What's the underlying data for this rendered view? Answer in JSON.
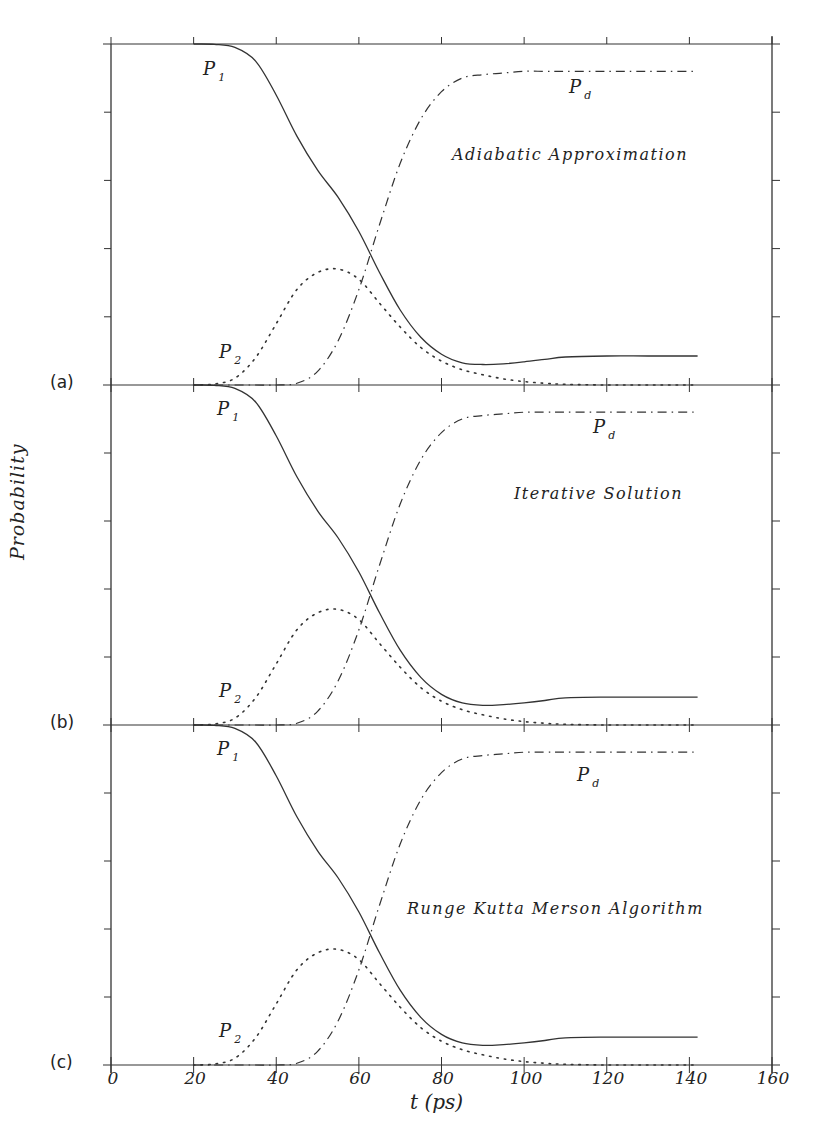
{
  "figure": {
    "y_axis_label": "Probability",
    "x_axis_label": "t (ps)",
    "x_ticks": [
      "0",
      "20",
      "40",
      "60",
      "80",
      "100",
      "120",
      "140",
      "160"
    ],
    "panels": [
      {
        "tag": "(a)",
        "method": "Adiabatic Approximation"
      },
      {
        "tag": "(b)",
        "method": "Iterative Solution"
      },
      {
        "tag": "(c)",
        "method": "Runge Kutta Merson Algorithm"
      }
    ],
    "curve_labels": {
      "p1": "P",
      "p1_sub": "1",
      "p2": "P",
      "p2_sub": "2",
      "pd": "P",
      "pd_sub": "d"
    }
  },
  "chart_data": [
    {
      "type": "line",
      "title": "Adiabatic Approximation",
      "panel": "(a)",
      "xlabel": "t (ps)",
      "ylabel": "Probability",
      "xlim": [
        0,
        160
      ],
      "ylim": [
        0,
        1
      ],
      "grid": false,
      "x": [
        20,
        25,
        30,
        35,
        40,
        45,
        50,
        55,
        60,
        65,
        70,
        75,
        80,
        85,
        90,
        95,
        100,
        105,
        110,
        120,
        130,
        142
      ],
      "series": [
        {
          "name": "P1",
          "style": "solid",
          "values": [
            1.0,
            0.999,
            0.99,
            0.95,
            0.85,
            0.73,
            0.63,
            0.55,
            0.45,
            0.33,
            0.22,
            0.14,
            0.09,
            0.065,
            0.06,
            0.062,
            0.068,
            0.075,
            0.082,
            0.085,
            0.085,
            0.085
          ]
        },
        {
          "name": "P2",
          "style": "dotted",
          "values": [
            0.0,
            0.003,
            0.02,
            0.08,
            0.18,
            0.28,
            0.33,
            0.34,
            0.31,
            0.24,
            0.17,
            0.11,
            0.07,
            0.045,
            0.03,
            0.018,
            0.01,
            0.005,
            0.002,
            0.0,
            0.0,
            0.0
          ]
        },
        {
          "name": "Pd",
          "style": "dash-dot",
          "values": [
            0.0,
            0.0,
            0.0,
            0.0,
            0.0,
            0.005,
            0.04,
            0.13,
            0.28,
            0.47,
            0.65,
            0.78,
            0.86,
            0.9,
            0.91,
            0.915,
            0.92,
            0.92,
            0.92,
            0.92,
            0.92,
            0.92
          ]
        }
      ],
      "labels": [
        {
          "text": "P1",
          "x": 28,
          "y": 0.93
        },
        {
          "text": "P2",
          "x": 27,
          "y": 0.05
        },
        {
          "text": "Pd",
          "x": 113,
          "y": 0.86
        }
      ]
    },
    {
      "type": "line",
      "title": "Iterative Solution",
      "panel": "(b)",
      "xlabel": "t (ps)",
      "ylabel": "Probability",
      "xlim": [
        0,
        160
      ],
      "ylim": [
        0,
        1
      ],
      "grid": false,
      "x": [
        20,
        25,
        30,
        35,
        40,
        45,
        50,
        55,
        60,
        65,
        70,
        75,
        80,
        85,
        90,
        95,
        100,
        105,
        110,
        120,
        130,
        142
      ],
      "series": [
        {
          "name": "P1",
          "style": "solid",
          "values": [
            1.0,
            0.999,
            0.99,
            0.95,
            0.85,
            0.73,
            0.63,
            0.55,
            0.45,
            0.33,
            0.22,
            0.14,
            0.09,
            0.065,
            0.058,
            0.06,
            0.065,
            0.072,
            0.08,
            0.082,
            0.082,
            0.082
          ]
        },
        {
          "name": "P2",
          "style": "dotted",
          "values": [
            0.0,
            0.003,
            0.02,
            0.08,
            0.18,
            0.28,
            0.33,
            0.34,
            0.31,
            0.24,
            0.17,
            0.11,
            0.07,
            0.045,
            0.03,
            0.018,
            0.01,
            0.005,
            0.002,
            0.0,
            0.0,
            0.0
          ]
        },
        {
          "name": "Pd",
          "style": "dash-dot",
          "values": [
            0.0,
            0.0,
            0.0,
            0.0,
            0.0,
            0.005,
            0.04,
            0.13,
            0.28,
            0.47,
            0.65,
            0.78,
            0.86,
            0.9,
            0.91,
            0.915,
            0.92,
            0.92,
            0.92,
            0.92,
            0.92,
            0.92
          ]
        }
      ],
      "labels": [
        {
          "text": "P1",
          "x": 28,
          "y": 0.93
        },
        {
          "text": "P2",
          "x": 27,
          "y": 0.05
        },
        {
          "text": "Pd",
          "x": 113,
          "y": 0.86
        }
      ]
    },
    {
      "type": "line",
      "title": "Runge Kutta Merson Algorithm",
      "panel": "(c)",
      "xlabel": "t (ps)",
      "ylabel": "Probability",
      "xlim": [
        0,
        160
      ],
      "ylim": [
        0,
        1
      ],
      "grid": false,
      "x": [
        20,
        25,
        30,
        35,
        40,
        45,
        50,
        55,
        60,
        65,
        70,
        75,
        80,
        85,
        90,
        95,
        100,
        105,
        110,
        120,
        130,
        142
      ],
      "series": [
        {
          "name": "P1",
          "style": "solid",
          "values": [
            1.0,
            0.999,
            0.99,
            0.95,
            0.85,
            0.73,
            0.63,
            0.55,
            0.45,
            0.33,
            0.22,
            0.14,
            0.09,
            0.065,
            0.058,
            0.06,
            0.065,
            0.072,
            0.08,
            0.082,
            0.082,
            0.082
          ]
        },
        {
          "name": "P2",
          "style": "dotted",
          "values": [
            0.0,
            0.003,
            0.02,
            0.08,
            0.18,
            0.28,
            0.33,
            0.34,
            0.31,
            0.24,
            0.17,
            0.11,
            0.07,
            0.045,
            0.03,
            0.018,
            0.01,
            0.005,
            0.002,
            0.0,
            0.0,
            0.0
          ]
        },
        {
          "name": "Pd",
          "style": "dash-dot",
          "values": [
            0.0,
            0.0,
            0.0,
            0.0,
            0.0,
            0.005,
            0.04,
            0.13,
            0.28,
            0.47,
            0.65,
            0.78,
            0.86,
            0.9,
            0.91,
            0.915,
            0.92,
            0.92,
            0.92,
            0.92,
            0.92,
            0.92
          ]
        }
      ],
      "labels": [
        {
          "text": "P1",
          "x": 28,
          "y": 0.93
        },
        {
          "text": "P2",
          "x": 27,
          "y": 0.05
        },
        {
          "text": "Pd",
          "x": 113,
          "y": 0.86
        }
      ]
    }
  ]
}
